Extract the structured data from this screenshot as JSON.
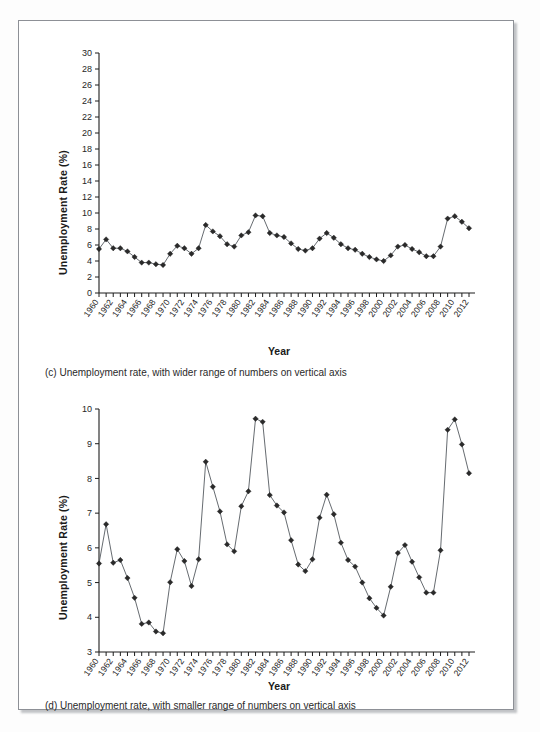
{
  "figure": {
    "background_color": "#ffffff",
    "frame_color": "#8d9096",
    "marker_color": "#2a2a2a",
    "line_color": "#555a60"
  },
  "panels": [
    {
      "id": "c",
      "caption": "(c) Unemployment rate, with wider range of numbers on vertical axis",
      "xlabel": "Year",
      "ylabel": "Unemployment Rate (%)"
    },
    {
      "id": "d",
      "caption": "(d) Unemployment rate, with smaller range of numbers on vertical axis",
      "xlabel": "Year",
      "ylabel": "Unemployment Rate (%)"
    }
  ],
  "chart_data": [
    {
      "type": "line",
      "panel": "c",
      "title": "",
      "xlabel": "Year",
      "ylabel": "Unemployment Rate (%)",
      "ylim": [
        0,
        30
      ],
      "yticks": [
        0,
        2,
        4,
        6,
        8,
        10,
        12,
        14,
        16,
        18,
        20,
        22,
        24,
        26,
        28,
        30
      ],
      "xlim": [
        1960,
        2012
      ],
      "xticks": [
        1960,
        1962,
        1964,
        1966,
        1968,
        1970,
        1972,
        1974,
        1976,
        1978,
        1980,
        1982,
        1984,
        1986,
        1988,
        1990,
        1992,
        1994,
        1996,
        1998,
        2000,
        2002,
        2004,
        2006,
        2008,
        2010,
        2012
      ],
      "grid": false,
      "legend": "none",
      "marker": "diamond",
      "x": [
        1960,
        1961,
        1962,
        1963,
        1964,
        1965,
        1966,
        1967,
        1968,
        1969,
        1970,
        1971,
        1972,
        1973,
        1974,
        1975,
        1976,
        1977,
        1978,
        1979,
        1980,
        1981,
        1982,
        1983,
        1984,
        1985,
        1986,
        1987,
        1988,
        1989,
        1990,
        1991,
        1992,
        1993,
        1994,
        1995,
        1996,
        1997,
        1998,
        1999,
        2000,
        2001,
        2002,
        2003,
        2004,
        2005,
        2006,
        2007,
        2008,
        2009,
        2010,
        2011,
        2012
      ],
      "values": [
        5.5,
        6.7,
        5.6,
        5.6,
        5.2,
        4.5,
        3.8,
        3.8,
        3.6,
        3.5,
        4.9,
        5.9,
        5.6,
        4.9,
        5.6,
        8.5,
        7.7,
        7.1,
        6.1,
        5.8,
        7.2,
        7.6,
        9.7,
        9.6,
        7.5,
        7.2,
        7.0,
        6.2,
        5.5,
        5.3,
        5.6,
        6.8,
        7.5,
        6.9,
        6.1,
        5.6,
        5.4,
        4.9,
        4.5,
        4.2,
        4.0,
        4.7,
        5.8,
        6.0,
        5.5,
        5.1,
        4.6,
        4.6,
        5.8,
        9.3,
        9.6,
        8.9,
        8.1
      ]
    },
    {
      "type": "line",
      "panel": "d",
      "title": "",
      "xlabel": "Year",
      "ylabel": "Unemployment Rate (%)",
      "ylim": [
        3,
        10
      ],
      "yticks": [
        3,
        4,
        5,
        6,
        7,
        8,
        9,
        10
      ],
      "xlim": [
        1960,
        2012
      ],
      "xticks": [
        1960,
        1962,
        1964,
        1966,
        1968,
        1970,
        1972,
        1974,
        1976,
        1978,
        1980,
        1982,
        1984,
        1986,
        1988,
        1990,
        1992,
        1994,
        1996,
        1998,
        2000,
        2002,
        2004,
        2006,
        2008,
        2010,
        2012
      ],
      "grid": false,
      "legend": "none",
      "marker": "diamond",
      "x": [
        1960,
        1961,
        1962,
        1963,
        1964,
        1965,
        1966,
        1967,
        1968,
        1969,
        1970,
        1971,
        1972,
        1973,
        1974,
        1975,
        1976,
        1977,
        1978,
        1979,
        1980,
        1981,
        1982,
        1983,
        1984,
        1985,
        1986,
        1987,
        1988,
        1989,
        1990,
        1991,
        1992,
        1993,
        1994,
        1995,
        1996,
        1997,
        1998,
        1999,
        2000,
        2001,
        2002,
        2003,
        2004,
        2005,
        2006,
        2007,
        2008,
        2009,
        2010,
        2011,
        2012
      ],
      "values": [
        5.55,
        6.68,
        5.57,
        5.65,
        5.13,
        4.56,
        3.81,
        3.85,
        3.59,
        3.54,
        5.01,
        5.96,
        5.62,
        4.9,
        5.67,
        8.48,
        7.76,
        7.05,
        6.1,
        5.9,
        7.2,
        7.63,
        9.72,
        9.63,
        7.52,
        7.22,
        7.02,
        6.22,
        5.52,
        5.33,
        5.67,
        6.87,
        7.53,
        6.97,
        6.15,
        5.65,
        5.46,
        5.0,
        4.55,
        4.27,
        4.05,
        4.88,
        5.85,
        6.08,
        5.6,
        5.15,
        4.71,
        4.71,
        5.93,
        9.4,
        9.7,
        8.98,
        8.15
      ]
    }
  ]
}
